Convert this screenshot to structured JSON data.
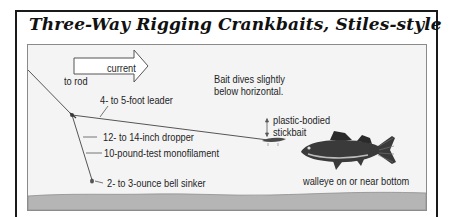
{
  "title": "Three-Way Rigging Crankbaits, Stiles-style",
  "labels": {
    "current": "current",
    "to_rod": "to rod",
    "leader": "4- to 5-foot leader",
    "dropper": "12- to 14-inch dropper",
    "monofilament": "10-pound-test monofilament",
    "sinker": "2- to 3-ounce bell sinker",
    "bait_dives_line1": "Bait dives slightly",
    "bait_dives_line2": "below horizontal.",
    "stickbait_line1": "plastic-bodied",
    "stickbait_line2": "stickbait",
    "walleye": "walleye on or near bottom"
  },
  "icons": {
    "current_arrow": "current-arrow-icon",
    "swivel": "three-way-swivel-icon",
    "sinker": "bell-sinker-icon",
    "stickbait": "stickbait-lure-icon",
    "walleye": "walleye-fish-icon",
    "depth_arrow": "up-down-arrow-icon"
  },
  "colors": {
    "frame": "#1a1a1a",
    "panel_bg": "#f4f4f4",
    "bottom": "#b5b5b5",
    "line": "#555555",
    "text": "#1e1e1e"
  }
}
